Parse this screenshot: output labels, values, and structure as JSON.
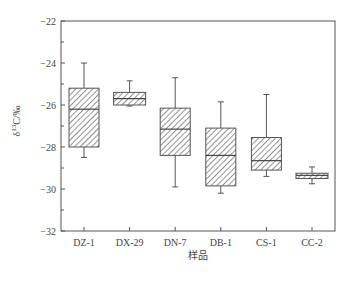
{
  "chart_data": {
    "type": "box",
    "title": "",
    "xlabel": "样品",
    "ylabel": "δ13C/‰",
    "ylabel_parts": {
      "prefix": "δ",
      "sup": "13",
      "suffix": "C/‰"
    },
    "ylim": [
      -32,
      -22
    ],
    "yticks": [
      -22,
      -24,
      -26,
      -28,
      -30,
      -32
    ],
    "yminor_ticks": [
      -23,
      -25,
      -27,
      -29,
      -31
    ],
    "grid": false,
    "legend": null,
    "categories": [
      "DZ-1",
      "DX-29",
      "DN-7",
      "DB-1",
      "CS-1",
      "CC-2"
    ],
    "series": [
      {
        "name": "DZ-1",
        "whisker_high": -24.0,
        "q3": -25.2,
        "median": -26.2,
        "q1": -28.0,
        "whisker_low": -28.5
      },
      {
        "name": "DX-29",
        "whisker_high": -24.85,
        "q3": -25.4,
        "median": -25.7,
        "q1": -26.0,
        "whisker_low": -26.05
      },
      {
        "name": "DN-7",
        "whisker_high": -24.7,
        "q3": -26.15,
        "median": -27.15,
        "q1": -28.4,
        "whisker_low": -29.9
      },
      {
        "name": "DB-1",
        "whisker_high": -25.85,
        "q3": -27.1,
        "median": -28.4,
        "q1": -29.85,
        "whisker_low": -30.2
      },
      {
        "name": "CS-1",
        "whisker_high": -25.5,
        "q3": -27.55,
        "median": -28.65,
        "q1": -29.1,
        "whisker_low": -29.4
      },
      {
        "name": "CC-2",
        "whisker_high": -28.95,
        "q3": -29.25,
        "median": -29.35,
        "q1": -29.5,
        "whisker_low": -29.75
      }
    ],
    "style": {
      "box_fill": "hatch-diagonal",
      "line_color": "#555555",
      "hatch_color": "#666666"
    }
  }
}
